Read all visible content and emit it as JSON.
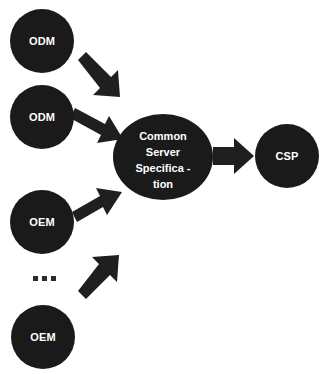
{
  "diagram": {
    "background_color": "#ffffff",
    "shape_color": "#1a1a1a",
    "arrow_color": "#1f1f1f",
    "label_color": "#ffffff",
    "nodes": {
      "odm_1": {
        "label": "ODM"
      },
      "odm_2": {
        "label": "ODM"
      },
      "oem_1": {
        "label": "OEM"
      },
      "oem_2": {
        "label": "OEM"
      },
      "ellipsis": {
        "label": "..."
      },
      "spec": {
        "label": "Common Server Specifica - tion",
        "line1": "Common",
        "line2": "Server",
        "line3": "Specifica -",
        "line4": "tion"
      },
      "csp": {
        "label": "CSP"
      }
    },
    "edges": [
      {
        "name": "odm-1-to-spec",
        "from": "ODM",
        "to": "Common Server Specification",
        "direction": "down-right"
      },
      {
        "name": "odm-2-to-spec",
        "from": "ODM",
        "to": "Common Server Specification",
        "direction": "down-right"
      },
      {
        "name": "oem-1-to-spec",
        "from": "OEM",
        "to": "Common Server Specification",
        "direction": "up-right"
      },
      {
        "name": "oem-2-to-spec",
        "from": "OEM",
        "to": "Common Server Specification",
        "direction": "up-right"
      },
      {
        "name": "spec-to-csp",
        "from": "Common Server Specification",
        "to": "CSP",
        "direction": "right"
      }
    ]
  }
}
